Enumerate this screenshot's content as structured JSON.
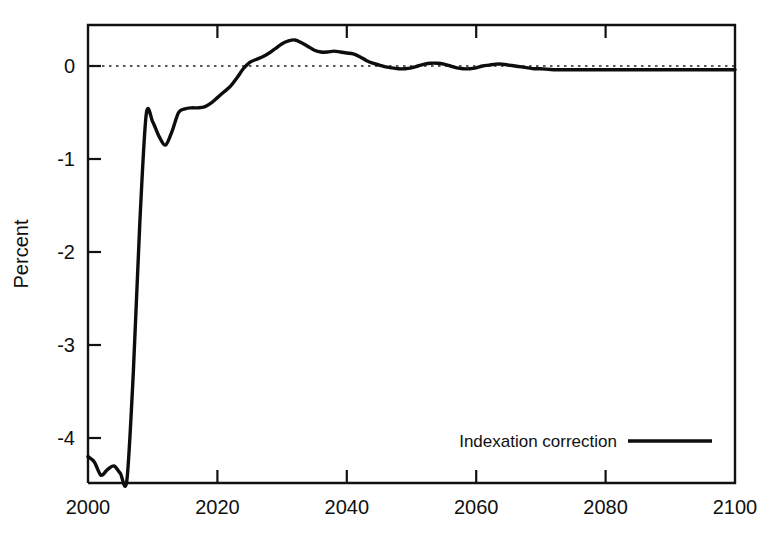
{
  "chart_data": {
    "type": "line",
    "title": "",
    "xlabel": "",
    "ylabel": "Percent",
    "xlim": [
      2000,
      2100
    ],
    "ylim": [
      -4.6,
      0.55
    ],
    "grid": false,
    "zero_reference_line": true,
    "legend_position": "bottom-right",
    "x_ticks": [
      2000,
      2020,
      2040,
      2060,
      2080,
      2100
    ],
    "x_tick_labels": [
      "2000",
      "2020",
      "2040",
      "2060",
      "2080",
      "2100"
    ],
    "y_ticks": [
      0,
      -1,
      -2,
      -3,
      -4
    ],
    "y_tick_labels": [
      "0",
      "-1",
      "-2",
      "-3",
      "-4"
    ],
    "series": [
      {
        "name": "Indexation correction",
        "color": "#0d0d0d",
        "x": [
          2000,
          2001,
          2002,
          2003,
          2004,
          2005,
          2006,
          2007,
          2008,
          2009,
          2010,
          2011,
          2012,
          2013,
          2014,
          2015,
          2016,
          2017,
          2018,
          2019,
          2020,
          2021,
          2022,
          2023,
          2024,
          2025,
          2026,
          2027,
          2028,
          2029,
          2030,
          2031,
          2032,
          2033,
          2034,
          2035,
          2036,
          2037,
          2038,
          2039,
          2040,
          2041,
          2042,
          2043,
          2044,
          2045,
          2046,
          2047,
          2048,
          2049,
          2050,
          2051,
          2052,
          2053,
          2054,
          2055,
          2056,
          2057,
          2058,
          2059,
          2060,
          2061,
          2062,
          2063,
          2064,
          2065,
          2066,
          2067,
          2068,
          2069,
          2070,
          2072,
          2074,
          2076,
          2078,
          2080,
          2085,
          2090,
          2095,
          2100
        ],
        "y": [
          -4.2,
          -4.26,
          -4.4,
          -4.34,
          -4.3,
          -4.38,
          -4.46,
          -3.3,
          -1.7,
          -0.52,
          -0.6,
          -0.76,
          -0.85,
          -0.7,
          -0.5,
          -0.46,
          -0.45,
          -0.45,
          -0.44,
          -0.4,
          -0.34,
          -0.28,
          -0.22,
          -0.13,
          -0.03,
          0.04,
          0.07,
          0.1,
          0.14,
          0.19,
          0.24,
          0.27,
          0.28,
          0.25,
          0.21,
          0.17,
          0.15,
          0.15,
          0.16,
          0.15,
          0.14,
          0.13,
          0.1,
          0.06,
          0.03,
          0.01,
          -0.01,
          -0.02,
          -0.03,
          -0.03,
          -0.02,
          0.0,
          0.02,
          0.03,
          0.03,
          0.02,
          0.0,
          -0.02,
          -0.03,
          -0.03,
          -0.02,
          0.0,
          0.01,
          0.02,
          0.02,
          0.01,
          0.0,
          -0.01,
          -0.02,
          -0.03,
          -0.03,
          -0.04,
          -0.04,
          -0.04,
          -0.04,
          -0.04,
          -0.04,
          -0.04,
          -0.04,
          -0.04
        ]
      }
    ]
  },
  "legend": {
    "entries": [
      {
        "label": "Indexation correction"
      }
    ]
  },
  "axes": {
    "y_title": "Percent"
  }
}
